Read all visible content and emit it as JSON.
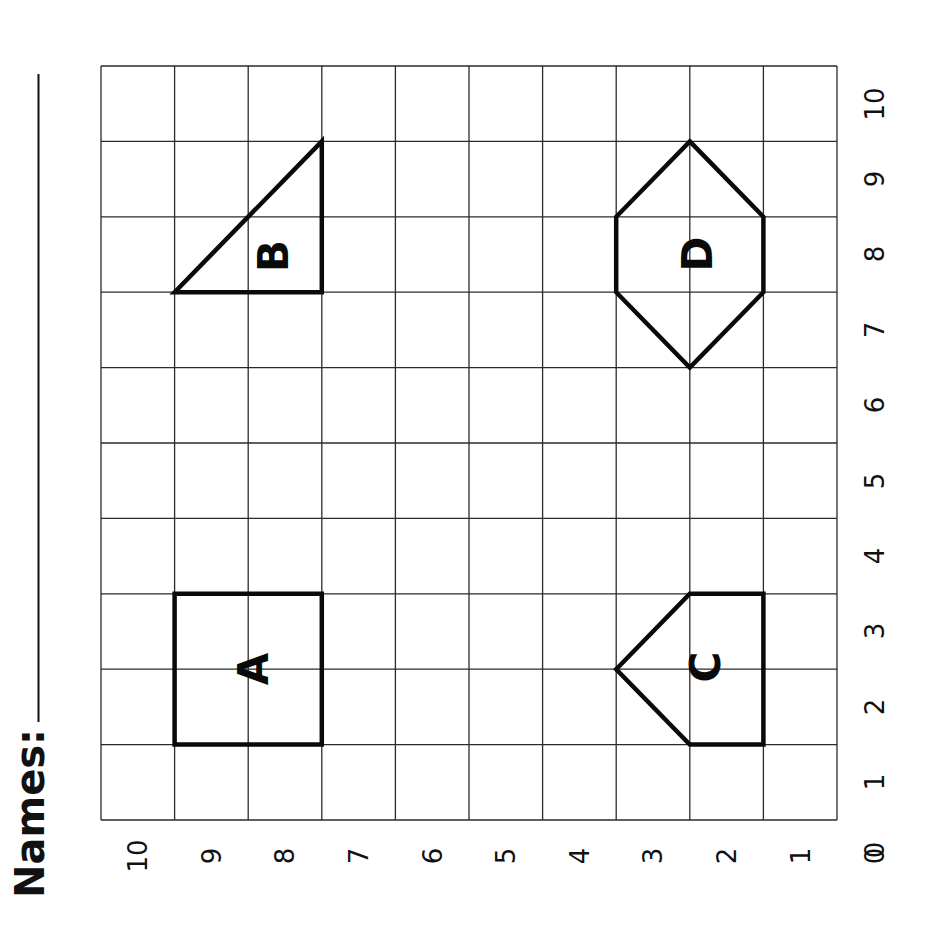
{
  "worksheet": {
    "names_label": "Names:",
    "grid": {
      "columns": 10,
      "rows": 10,
      "x_axis_ticks": [
        "0",
        "1",
        "2",
        "3",
        "4",
        "5",
        "6",
        "7",
        "8",
        "9",
        "10"
      ],
      "y_axis_ticks": [
        "0",
        "1",
        "2",
        "3",
        "4",
        "5",
        "6",
        "7",
        "8",
        "9",
        "10"
      ]
    },
    "shapes": [
      {
        "id": "A",
        "label": "A",
        "kind": "square"
      },
      {
        "id": "B",
        "label": "B",
        "kind": "right-triangle"
      },
      {
        "id": "C",
        "label": "C",
        "kind": "pentagon"
      },
      {
        "id": "D",
        "label": "D",
        "kind": "hexagon"
      }
    ]
  },
  "colors": {
    "ink": "#0a0a0a",
    "grid": "#2a2a2a",
    "paper": "#ffffff"
  }
}
